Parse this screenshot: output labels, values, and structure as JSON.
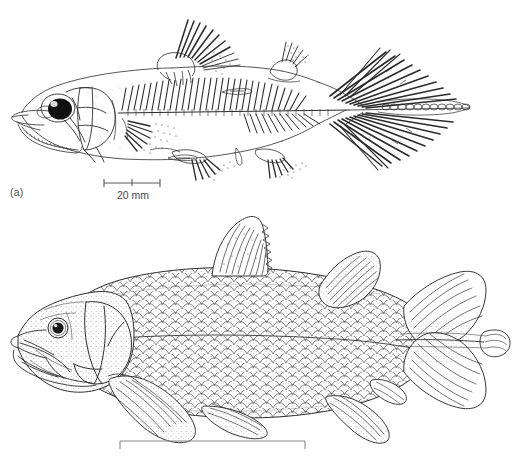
{
  "figure": {
    "type": "scientific-illustration",
    "background_color": "#ffffff",
    "ink_color": "#2b2b2b",
    "text_color": "#4a4a4a",
    "panels": [
      {
        "id": "a",
        "label": "(a)",
        "subject": "ray-finned fish lateral view with skeletal detail",
        "features": [
          "large dark eye",
          "opercular bones",
          "lower jaw with teeth",
          "rib series",
          "dorsal fin with ray detail",
          "adipose fin",
          "pectoral fin",
          "pelvic fin",
          "anal fin",
          "deeply forked caudal fin",
          "vertebral column"
        ],
        "scale_bar": {
          "label": "20 mm",
          "bar_left_px": 104,
          "bar_right_px": 160,
          "bar_y_px": 183,
          "has_center_tick": true
        }
      },
      {
        "id": "b",
        "label": "(b)",
        "subject": "coelacanth (Latimeria) lateral view with scales",
        "features": [
          "round eye",
          "gular plates",
          "cheek plate",
          "cosmoid scale covering",
          "first dorsal fin spiny fan",
          "second dorsal lobed fin",
          "lobed pectoral fin",
          "lobed pelvic fin",
          "lobed anal fin",
          "three-lobed diphycercal caudal fin",
          "epicaudal lobe"
        ],
        "scale_bar": {
          "label": "1 m",
          "bar_left_px": 120,
          "bar_right_px": 305,
          "bar_y_px": 441,
          "has_center_tick": false
        }
      }
    ]
  }
}
